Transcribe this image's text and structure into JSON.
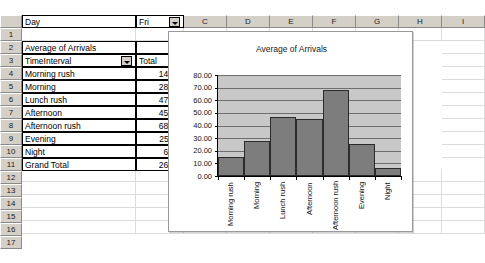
{
  "spreadsheet": {
    "column_headers": [
      "A",
      "B",
      "C",
      "D",
      "E",
      "F",
      "G",
      "H",
      "I"
    ],
    "row_headers": [
      "1",
      "2",
      "3",
      "4",
      "5",
      "6",
      "7",
      "8",
      "9",
      "10",
      "11",
      "12",
      "13",
      "14",
      "15",
      "16",
      "17"
    ],
    "cells": {
      "A1": "Day",
      "B1": "Fri",
      "A3": "Average of Arrivals",
      "A4": "TimeInterval",
      "B4": "Total",
      "A5": "Morning rush",
      "B5": "14.67",
      "A6": "Morning",
      "B6": "28.00",
      "A7": "Lunch rush",
      "B7": "47.00",
      "A8": "Afternoon",
      "B8": "45.33",
      "A9": "Afternoon rush",
      "B9": "68.25",
      "A10": "Evening",
      "B10": "25.11",
      "A11": "Night",
      "B11": "6.64",
      "A12": "Grand Total",
      "B12": "26.67"
    },
    "filters": {
      "day_filter_icon": "chevron-down-icon",
      "timeinterval_filter_icon": "chevron-down-icon"
    }
  },
  "chart_data": {
    "type": "bar",
    "title": "Average of Arrivals",
    "xlabel": "",
    "ylabel": "",
    "categories": [
      "Morning rush",
      "Morning",
      "Lunch rush",
      "Afternoon",
      "Afternoon rush",
      "Evening",
      "Night"
    ],
    "values": [
      14.67,
      28.0,
      47.0,
      45.33,
      68.25,
      25.11,
      6.64
    ],
    "ylim": [
      0,
      80
    ],
    "ytick_labels": [
      "0.00",
      "10.00",
      "20.00",
      "30.00",
      "40.00",
      "50.00",
      "60.00",
      "70.00",
      "80.00"
    ],
    "ytick_values": [
      0,
      10,
      20,
      30,
      40,
      50,
      60,
      70,
      80
    ],
    "grid": true,
    "legend": "none",
    "series_color": "#7d7d7d",
    "plot_background": "#c8c8c8"
  }
}
